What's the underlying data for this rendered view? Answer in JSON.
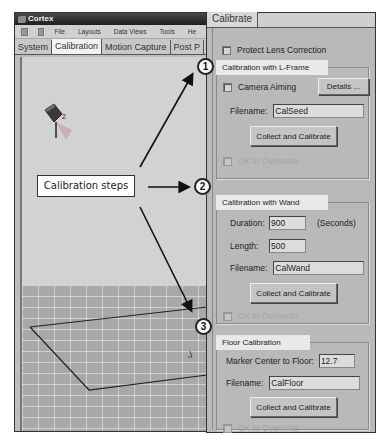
{
  "app": {
    "title": "Cortex",
    "menu": [
      "File",
      "Layouts",
      "Data Views",
      "Tools",
      "He"
    ],
    "toolbar_icons": [
      "settings-icon",
      "window-icon"
    ],
    "tabs": [
      {
        "label": "System",
        "active": false
      },
      {
        "label": "Calibration",
        "active": true
      },
      {
        "label": "Motion Capture",
        "active": false
      },
      {
        "label": "Post P",
        "active": false
      }
    ],
    "viewport": {
      "camera_label": "2"
    }
  },
  "annotation": {
    "callout_text": "Calibration steps",
    "markers": [
      "1",
      "2",
      "3"
    ]
  },
  "panel": {
    "tab": "Calibrate",
    "protect_lens": {
      "label": "Protect Lens Correction",
      "checked": false
    },
    "lframe": {
      "title": "Calibration with L-Frame",
      "camera_aiming": {
        "label": "Camera Aiming",
        "checked": false
      },
      "details_button": "Details ...",
      "filename_label": "Filename:",
      "filename_value": "CalSeed",
      "collect_button": "Collect and Calibrate",
      "overwrite": {
        "label": "OK to Overwrite",
        "checked": false,
        "enabled": false
      }
    },
    "wand": {
      "title": "Calibration with Wand",
      "duration_label": "Duration:",
      "duration_value": "900",
      "duration_unit": "(Seconds)",
      "length_label": "Length:",
      "length_value": "500",
      "filename_label": "Filename:",
      "filename_value": "CalWand",
      "collect_button": "Collect and Calibrate",
      "overwrite": {
        "label": "OK to Overwrite",
        "checked": false,
        "enabled": false
      }
    },
    "floor": {
      "title": "Floor Calibration",
      "marker_label": "Marker Center to Floor:",
      "marker_value": "12.7",
      "filename_label": "Filename:",
      "filename_value": "CalFloor",
      "collect_button": "Collect and Calibrate",
      "overwrite": {
        "label": "OK to Overwrite",
        "checked": false,
        "enabled": false
      }
    }
  }
}
